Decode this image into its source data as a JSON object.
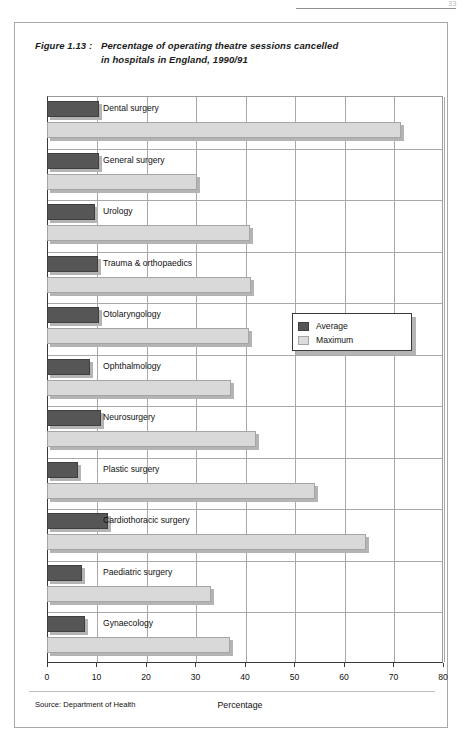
{
  "page": {
    "number": "33"
  },
  "figure": {
    "label": "Figure 1.13 :",
    "title_line1": "Percentage of operating theatre sessions cancelled",
    "title_line2": "in hospitals in England, 1990/91",
    "source": "Source: Department of Health"
  },
  "legend": {
    "items": [
      {
        "label": "Average",
        "color": "#565656"
      },
      {
        "label": "Maximum",
        "color": "#dcdcdc"
      }
    ]
  },
  "chart_data": {
    "type": "bar",
    "orientation": "horizontal",
    "xlabel": "Percentage",
    "ylabel": "",
    "xlim": [
      0,
      80
    ],
    "xticks": [
      0,
      10,
      20,
      30,
      40,
      50,
      60,
      70,
      80
    ],
    "xtick_labels": [
      "0",
      "10",
      "20",
      "30",
      "40",
      "50",
      "60",
      "70",
      "80"
    ],
    "grid": true,
    "legend_position": "middle-right",
    "categories": [
      "Dental surgery",
      "General surgery",
      "Urology",
      "Trauma & orthopaedics",
      "Otolaryngology",
      "Ophthalmology",
      "Neurosurgery",
      "Plastic surgery",
      "Cardiothoracic surgery",
      "Paediatric surgery",
      "Gynaecology"
    ],
    "series": [
      {
        "name": "Average",
        "color": "#565656",
        "values": [
          10.6,
          10.6,
          9.6,
          10.3,
          10.5,
          8.6,
          11.0,
          6.3,
          12.3,
          7.1,
          7.6
        ]
      },
      {
        "name": "Maximum",
        "color": "#d9d9d9",
        "values": [
          71.5,
          30.3,
          41.0,
          41.3,
          40.8,
          37.2,
          42.3,
          54.1,
          64.5,
          33.2,
          36.9
        ]
      }
    ]
  }
}
